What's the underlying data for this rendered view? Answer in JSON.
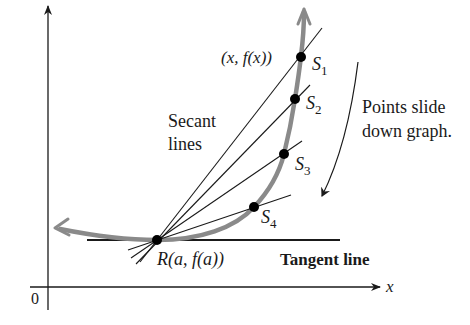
{
  "diagram": {
    "axes": {
      "x_label": "x",
      "origin_label": "0"
    },
    "point_r": {
      "label_prefix": "R",
      "label_args": "(a, f(a))"
    },
    "moving_point": {
      "label": "(x, f(x))"
    },
    "secant_points": [
      {
        "name": "S",
        "sub": "1"
      },
      {
        "name": "S",
        "sub": "2"
      },
      {
        "name": "S",
        "sub": "3"
      },
      {
        "name": "S",
        "sub": "4"
      }
    ],
    "labels": {
      "secant_line1": "Secant",
      "secant_line2": "lines",
      "slide_line1": "Points slide",
      "slide_line2": "down graph.",
      "tangent": "Tangent line"
    },
    "colors": {
      "curve": "#8a8a8a",
      "lines": "#1a1a1a",
      "points": "#000000",
      "background": "#ffffff"
    }
  }
}
